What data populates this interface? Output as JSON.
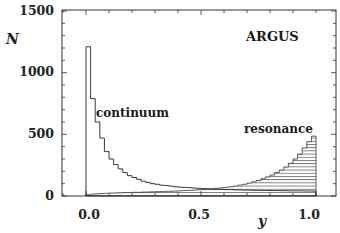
{
  "chart_data": {
    "type": "bar",
    "subtype": "step-histogram",
    "title": "",
    "annotations": {
      "experiment": "ARGUS",
      "continuum_label": "continuum",
      "resonance_label": "resonance"
    },
    "xlabel": "y",
    "ylabel": "N",
    "xlim": [
      -0.11,
      1.09
    ],
    "ylim": [
      0,
      1500
    ],
    "x_ticks": [
      0.0,
      0.5,
      1.0
    ],
    "x_tick_labels": [
      "0.0",
      "0.5",
      "1.0"
    ],
    "y_ticks": [
      0,
      500,
      1000,
      1500
    ],
    "y_tick_labels": [
      "0",
      "500",
      "1000",
      "1500"
    ],
    "grid": false,
    "legend": "none (inline text labels)",
    "bin_width": 0.02,
    "bin_edges_start": 0.0,
    "series": [
      {
        "name": "continuum",
        "style": "open step line",
        "values": [
          1210,
          790,
          600,
          470,
          360,
          300,
          255,
          220,
          190,
          165,
          150,
          135,
          120,
          110,
          100,
          95,
          88,
          85,
          80,
          75,
          72,
          70,
          68,
          65,
          62,
          60,
          58,
          56,
          55,
          54,
          52,
          52,
          50,
          50,
          48,
          48,
          46,
          46,
          45,
          45,
          44,
          44,
          43,
          43,
          42,
          42,
          42,
          41,
          41,
          40
        ]
      },
      {
        "name": "resonance",
        "style": "hatched (horizontal lines)",
        "values": [
          10,
          15,
          18,
          20,
          22,
          24,
          25,
          26,
          28,
          28,
          30,
          30,
          32,
          32,
          34,
          35,
          36,
          38,
          38,
          40,
          42,
          44,
          46,
          48,
          50,
          52,
          55,
          58,
          62,
          66,
          70,
          75,
          80,
          88,
          95,
          105,
          115,
          125,
          140,
          155,
          170,
          190,
          210,
          235,
          265,
          300,
          340,
          390,
          440,
          485
        ]
      }
    ]
  },
  "axes": {
    "y_title": "N",
    "x_title": "y",
    "y_tick_labels": [
      "0",
      "500",
      "1000",
      "1500"
    ],
    "x_tick_labels": [
      "0.0",
      "0.5",
      "1.0"
    ]
  },
  "labels": {
    "experiment": "ARGUS",
    "continuum": "continuum",
    "resonance": "resonance"
  },
  "colors": {
    "ink": "#1a1a1a",
    "background": "#ffffff"
  }
}
